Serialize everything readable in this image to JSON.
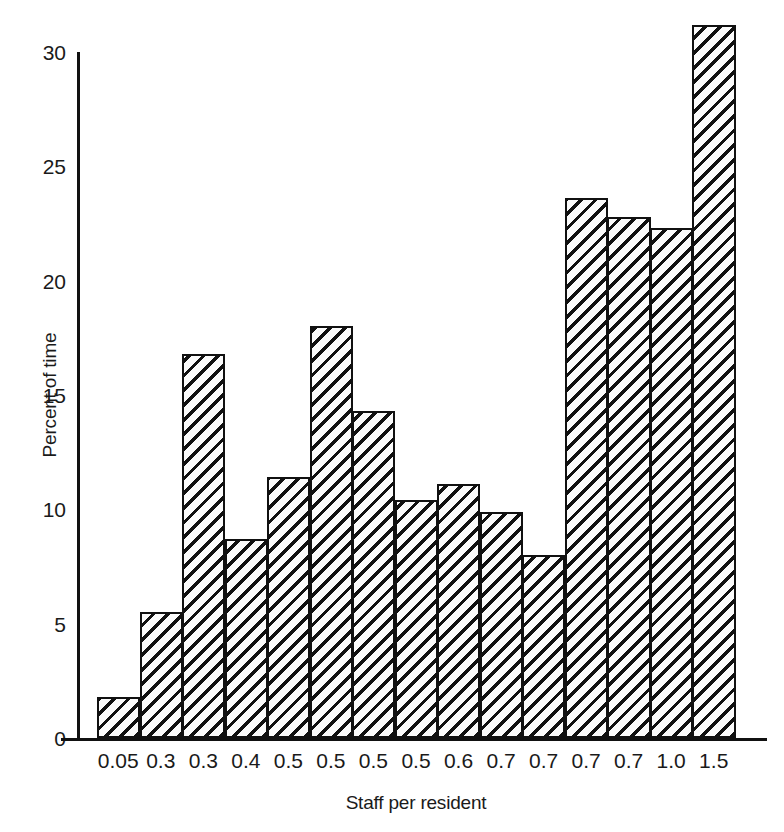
{
  "chart_data": {
    "type": "bar",
    "title": "",
    "subtitle": "",
    "xlabel": "Staff per resident",
    "ylabel": "Percent of time",
    "categories": [
      "0.05",
      "0.3",
      "0.3",
      "0.4",
      "0.5",
      "0.5",
      "0.5",
      "0.5",
      "0.6",
      "0.7",
      "0.7",
      "0.7",
      "0.7",
      "1.0",
      "1.5"
    ],
    "values": [
      1.8,
      5.5,
      16.8,
      8.7,
      11.4,
      18.0,
      14.3,
      10.4,
      11.1,
      9.9,
      8.0,
      23.6,
      22.8,
      22.3,
      31.2
    ],
    "ylim": [
      0,
      32.5
    ],
    "xlim": [
      0,
      15
    ],
    "yticks": [
      0,
      5,
      10,
      15,
      20,
      25,
      30
    ],
    "ytick_labels": [
      "0",
      "5",
      "10",
      "15",
      "20",
      "25",
      "30"
    ],
    "grid": false,
    "legend": null,
    "legend_position": "none",
    "bar_fill_pattern": "diagonal-hatch",
    "bar_edge_color": "#111111",
    "bar_fill_color": "#fbfbfb",
    "axis_color": "#111111",
    "background_color": "#ffffff",
    "annotations": []
  }
}
